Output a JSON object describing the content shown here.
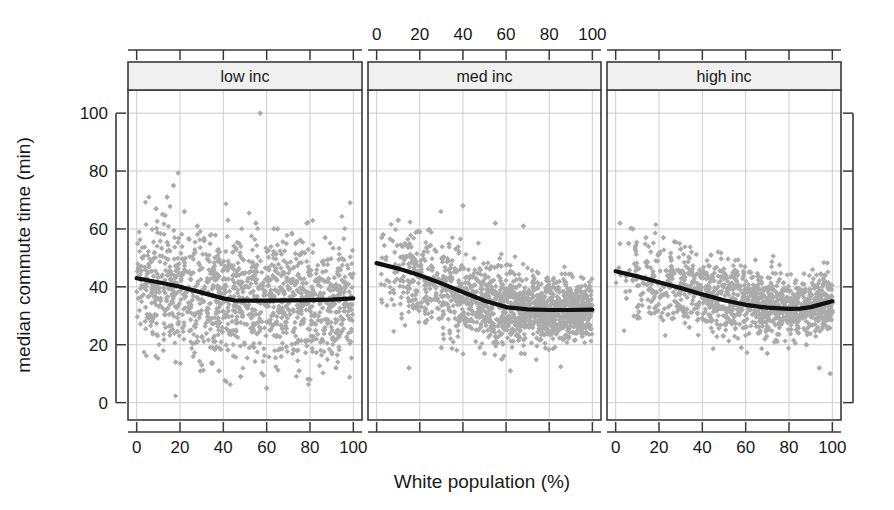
{
  "chart_data": {
    "type": "scatter",
    "title": "",
    "xlabel": "White population (%)",
    "ylabel": "median commute time (min)",
    "xlim": [
      -4,
      104
    ],
    "ylim": [
      -6,
      108
    ],
    "xticks": [
      0,
      20,
      40,
      60,
      80,
      100
    ],
    "yticks": [
      0,
      20,
      40,
      60,
      80,
      100
    ],
    "xtick_labels": [
      "0",
      "20",
      "40",
      "60",
      "80",
      "100"
    ],
    "ytick_labels": [
      "0",
      "20",
      "40",
      "60",
      "80",
      "100"
    ],
    "grid": true,
    "legend": "none",
    "layout": "3 horizontal facet panels sharing a common y axis; x tick labels shown on bottom for panels 1 and 3 and on top for panel 2",
    "point_marker": "diamond",
    "point_color": "#ababab",
    "trend_color": "#111111",
    "panels": [
      {
        "label": "low inc",
        "n_points": 1300,
        "cloud": {
          "x_range": [
            0,
            100
          ],
          "y_center_at_x": [
            [
              0,
              41
            ],
            [
              20,
              38
            ],
            [
              40,
              35
            ],
            [
              60,
              35
            ],
            [
              80,
              35
            ],
            [
              100,
              35
            ]
          ],
          "y_spread": 11,
          "outlier_high": 100,
          "outlier_low": 3
        },
        "trend": {
          "x": [
            0,
            10,
            20,
            30,
            40,
            45,
            50,
            60,
            70,
            80,
            90,
            100
          ],
          "y": [
            43.0,
            41.6,
            40.0,
            38.0,
            36.0,
            35.3,
            35.2,
            35.2,
            35.3,
            35.4,
            35.6,
            36.0
          ]
        }
      },
      {
        "label": "med inc",
        "n_points": 1500,
        "cloud": {
          "x_range": [
            0,
            100
          ],
          "y_center_at_x": [
            [
              0,
              46
            ],
            [
              20,
              42
            ],
            [
              40,
              37
            ],
            [
              60,
              33
            ],
            [
              80,
              32
            ],
            [
              100,
              32
            ]
          ],
          "y_spread": 9,
          "outlier_high": 68,
          "outlier_low": 11
        },
        "trend": {
          "x": [
            0,
            10,
            20,
            30,
            40,
            50,
            60,
            70,
            80,
            90,
            100
          ],
          "y": [
            48.2,
            46.3,
            44.0,
            41.2,
            38.2,
            35.2,
            33.0,
            32.2,
            32.0,
            32.0,
            32.1
          ]
        }
      },
      {
        "label": "high inc",
        "n_points": 1200,
        "cloud": {
          "x_range": [
            0,
            100
          ],
          "y_center_at_x": [
            [
              0,
              45
            ],
            [
              20,
              42
            ],
            [
              40,
              38
            ],
            [
              60,
              35
            ],
            [
              80,
              33
            ],
            [
              100,
              35
            ]
          ],
          "y_spread": 8,
          "outlier_high": 62,
          "outlier_low": 10
        },
        "trend": {
          "x": [
            0,
            10,
            20,
            30,
            40,
            50,
            60,
            70,
            80,
            85,
            90,
            100
          ],
          "y": [
            45.4,
            43.6,
            41.6,
            39.6,
            37.4,
            35.4,
            33.8,
            32.8,
            32.4,
            32.5,
            33.0,
            35.0
          ]
        }
      }
    ]
  }
}
